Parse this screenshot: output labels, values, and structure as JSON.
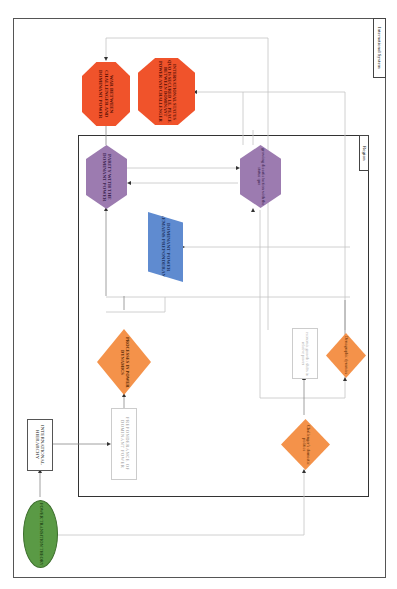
{
  "containers": {
    "outer_label": "International System",
    "region_label": "Region"
  },
  "nodes": {
    "power_transition_theory": "POWER TRANSITION THEORY",
    "international_hierarchy": "INTERNATIONAL HIERARCHY",
    "preponderance": "PREPONDERANCE OF DOMINANT POWER",
    "processes_power_dynamics": "PROCESSES IN POWER DYNAMICS",
    "dominant_power_remains": "DOMINANT POWER REMAINS PREPONDERANT",
    "parity": "PARITY WITH THE DOMINANT POWER",
    "growing_dissatisfaction": "growing dissatisfaction with the status quo",
    "war": "WAR BETWEEN CHALLENGER AND DOMINANT POWER",
    "status_quo_peace": "INTERNATIONAL STATUS QUO IS SECURED I.E. PEACE BETWEEN DOMINANT POWER AND CHALLENGER",
    "challengers_domestic": "Challenger's domestic politics",
    "demographic_dynamics": "Demographic dynamics",
    "economic_growth": "economic growth / shifts in relative power"
  },
  "colors": {
    "orange": "#f4924a",
    "red": "#f0532b",
    "purple": "#9c7bb0",
    "blue": "#5f8bd0",
    "green": "#5a9a45"
  }
}
